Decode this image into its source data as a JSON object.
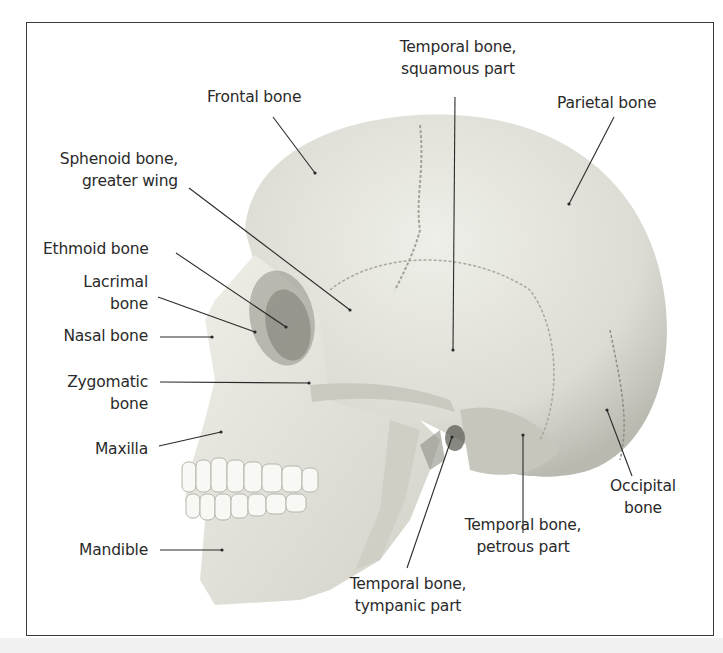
{
  "figure": {
    "type": "anatomical-diagram",
    "colors": {
      "frame": "#3a3a3a",
      "bone": "#e6e6df",
      "bone_shadow": "#bdbdb4",
      "label_text": "#2a2a2a",
      "leader_line": "#2a2a2a"
    }
  },
  "labels": {
    "frontal": {
      "line1": "Frontal bone"
    },
    "temporal_squamous": {
      "line1": "Temporal bone,",
      "line2": "squamous part"
    },
    "parietal": {
      "line1": "Parietal bone"
    },
    "sphenoid": {
      "line1": "Sphenoid bone,",
      "line2": "greater wing"
    },
    "ethmoid": {
      "line1": "Ethmoid bone"
    },
    "lacrimal": {
      "line1": "Lacrimal",
      "line2": "bone"
    },
    "nasal": {
      "line1": "Nasal bone"
    },
    "zygomatic": {
      "line1": "Zygomatic",
      "line2": "bone"
    },
    "maxilla": {
      "line1": "Maxilla"
    },
    "mandible": {
      "line1": "Mandible"
    },
    "occipital": {
      "line1": "Occipital",
      "line2": "bone"
    },
    "temporal_petrous": {
      "line1": "Temporal bone,",
      "line2": "petrous part"
    },
    "temporal_tympanic": {
      "line1": "Temporal bone,",
      "line2": "tympanic part"
    }
  }
}
